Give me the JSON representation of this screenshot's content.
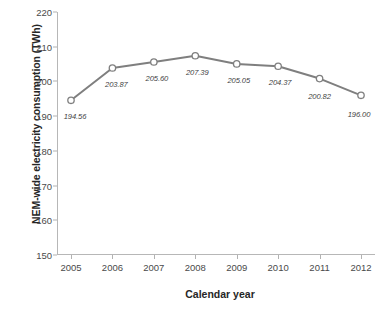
{
  "chart_data": {
    "type": "line",
    "title": "",
    "xlabel": "Calendar year",
    "ylabel": "NEM-wide electricity consumption (TWh)",
    "categories": [
      "2005",
      "2006",
      "2007",
      "2008",
      "2009",
      "2010",
      "2011",
      "2012"
    ],
    "values": [
      194.56,
      203.87,
      205.6,
      207.39,
      205.05,
      204.37,
      200.82,
      196.0
    ],
    "point_labels": [
      "194.56",
      "203.87",
      "205.60",
      "207.39",
      "205.05",
      "204.37",
      "200.82",
      "196.00"
    ],
    "ylim": [
      150,
      220
    ],
    "ytick_labels": [
      "220",
      "210",
      "200",
      "190",
      "180",
      "170",
      "160",
      "150"
    ],
    "ytick_values": [
      220,
      210,
      200,
      190,
      180,
      170,
      160,
      150
    ],
    "xlim": [
      2005,
      2012
    ],
    "grid": false,
    "legend": false,
    "legend_position": "none",
    "series_name": "NEM-wide electricity consumption",
    "line_color": "#7f7f7f",
    "marker_color": "#7f7f7f",
    "marker_fill": "#ffffff",
    "marker_shape": "circle",
    "axis_color": "#b7b7b7",
    "background_color": "#ffffff",
    "text_color": "#3a3a3a"
  }
}
